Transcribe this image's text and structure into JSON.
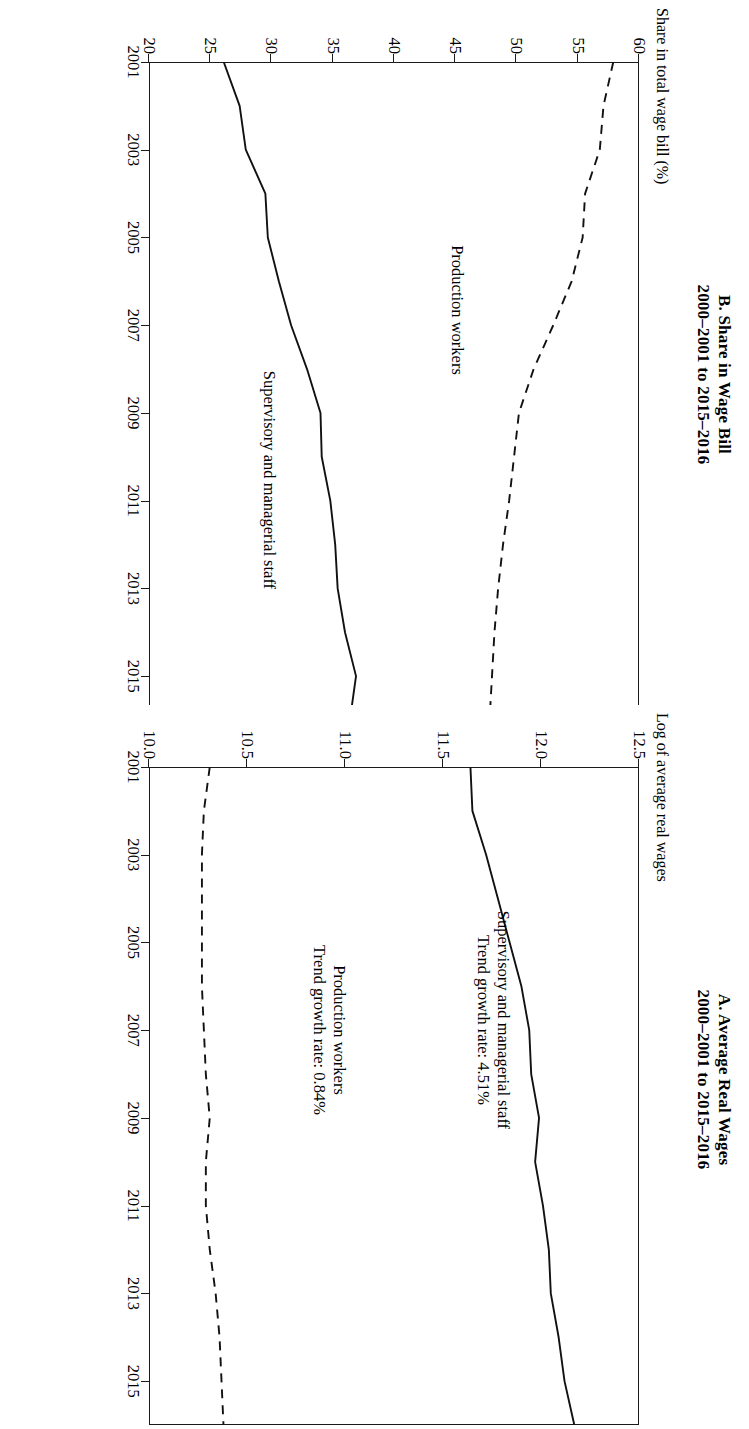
{
  "figure": {
    "orientation": "rotated-90-clockwise",
    "panel_count": 2
  },
  "panel_a": {
    "title_line1": "A. Average Real Wages",
    "title_line2": "2000–2001 to 2015–2016",
    "y_axis_label": "Log of average real wages",
    "annotation_supervisory": "Supervisory and managerial staff\nTrend growth rate: 4.51%",
    "annotation_production": "Production workers\nTrend growth rate: 0.84%",
    "y_ticks": [
      "10.0",
      "10.5",
      "11.0",
      "11.5",
      "12.0",
      "12.5"
    ],
    "x_ticks": [
      "2001",
      "2003",
      "2005",
      "2007",
      "2009",
      "2011",
      "2013",
      "2015"
    ]
  },
  "panel_b": {
    "title_line1": "B. Share in Wage Bill",
    "title_line2": "2000–2001 to 2015–2016",
    "y_axis_label": "Share in total wage bill (%)",
    "annotation_production": "Production workers",
    "annotation_supervisory": "Supervisory and managerial staff",
    "y_ticks": [
      "20",
      "25",
      "30",
      "35",
      "40",
      "45",
      "50",
      "55",
      "60"
    ],
    "x_ticks": [
      "2001",
      "2003",
      "2005",
      "2007",
      "2009",
      "2011",
      "2013",
      "2015"
    ]
  },
  "chart_data": [
    {
      "type": "line",
      "panel": "A",
      "title": "A. Average Real Wages 2000–2001 to 2015–2016",
      "xlabel": "",
      "ylabel": "Log of average real wages",
      "ylim": [
        10.0,
        12.5
      ],
      "xlim": [
        2001,
        2016
      ],
      "grid": false,
      "legend": "inline annotations",
      "x": [
        2001,
        2002,
        2003,
        2004,
        2005,
        2006,
        2007,
        2008,
        2009,
        2010,
        2011,
        2012,
        2013,
        2014,
        2015,
        2016
      ],
      "series": [
        {
          "name": "Supervisory and managerial staff",
          "style": "solid",
          "trend_growth_rate": "4.51%",
          "values": [
            11.64,
            11.65,
            11.72,
            11.78,
            11.84,
            11.9,
            11.94,
            11.95,
            11.99,
            11.97,
            12.01,
            12.04,
            12.05,
            12.09,
            12.12,
            12.17
          ]
        },
        {
          "name": "Production workers",
          "style": "dashed",
          "trend_growth_rate": "0.84%",
          "values": [
            10.31,
            10.28,
            10.27,
            10.27,
            10.27,
            10.27,
            10.28,
            10.29,
            10.31,
            10.29,
            10.29,
            10.31,
            10.34,
            10.36,
            10.37,
            10.38
          ]
        }
      ]
    },
    {
      "type": "line",
      "panel": "B",
      "title": "B. Share in Wage Bill 2000–2001 to 2015–2016",
      "xlabel": "",
      "ylabel": "Share in total wage bill (%)",
      "ylim": [
        20,
        60
      ],
      "xlim": [
        2001,
        2016
      ],
      "grid": false,
      "legend": "inline annotations",
      "x": [
        2001,
        2002,
        2003,
        2004,
        2005,
        2006,
        2007,
        2008,
        2009,
        2010,
        2011,
        2012,
        2013,
        2014,
        2015,
        2016
      ],
      "series": [
        {
          "name": "Production workers",
          "style": "dashed",
          "values": [
            57.9,
            57.1,
            56.8,
            55.6,
            55.4,
            54.5,
            53.0,
            51.4,
            50.2,
            49.8,
            49.4,
            48.9,
            48.5,
            48.2,
            48.0,
            47.8
          ]
        },
        {
          "name": "Supervisory and managerial staff",
          "style": "solid",
          "values": [
            26.1,
            27.4,
            27.9,
            29.5,
            29.7,
            30.6,
            31.6,
            32.9,
            34.0,
            34.1,
            34.8,
            35.2,
            35.4,
            36.0,
            36.9,
            36.4
          ]
        }
      ]
    }
  ]
}
